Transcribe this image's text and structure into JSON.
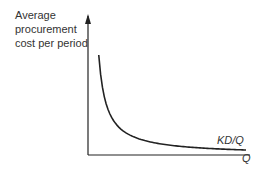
{
  "chart_data": {
    "type": "line",
    "title": "",
    "ylabel_lines": [
      "Average",
      "procurement",
      "cost per period"
    ],
    "xlabel": "Q",
    "curve_label": "KD/Q",
    "function": "KD/Q",
    "series": [
      {
        "name": "KD/Q",
        "x": [
          0.05,
          0.07,
          0.1,
          0.13,
          0.17,
          0.22,
          0.3,
          0.4,
          0.55,
          0.7,
          0.85,
          1.0
        ],
        "y": [
          1.0,
          0.714,
          0.5,
          0.385,
          0.294,
          0.227,
          0.167,
          0.125,
          0.091,
          0.071,
          0.059,
          0.05
        ]
      }
    ],
    "xlim": [
      0,
      1
    ],
    "ylim": [
      0,
      1.4
    ],
    "ticks": "none",
    "grid": false,
    "legend": "none"
  }
}
